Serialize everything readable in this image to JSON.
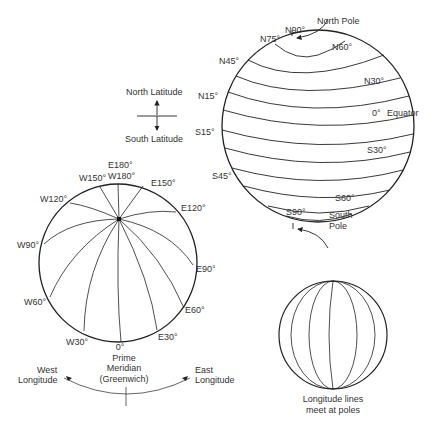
{
  "latitude_globe": {
    "labels": {
      "n90": "N90°",
      "n75": "N75°",
      "n60": "N60°",
      "n45": "N45°",
      "n30": "N30°",
      "n15": "N15°",
      "eq": "0°",
      "equator": "Equator",
      "s15": "S15°",
      "s30": "S30°",
      "s45": "S45°",
      "s60": "S60°",
      "s90": "S90°"
    },
    "north_pole": "North Pole",
    "south_pole_1": "South",
    "south_pole_2": "Pole"
  },
  "latitude_key": {
    "north": "North Latitude",
    "south": "South Latitude"
  },
  "longitude_globe": {
    "labels": {
      "e180": "E180°",
      "w180": "W180°",
      "w150": "W150°",
      "e150": "E150°",
      "w120": "W120°",
      "e120": "E120°",
      "w90": "W90°",
      "e90": "E90°",
      "w60": "W60°",
      "e60": "E60°",
      "w30": "W30°",
      "e30": "E30°",
      "zero": "0°"
    },
    "prime_1": "Prime",
    "prime_2": "Meridian",
    "prime_3": "(Greenwich)",
    "west_1": "West",
    "west_2": "Longitude",
    "east_1": "East",
    "east_2": "Longitude"
  },
  "small_globe": {
    "caption_1": "Longitude lines",
    "caption_2": "meet at poles"
  },
  "colors": {
    "line": "#222222",
    "text": "#333333",
    "background": "#ffffff"
  }
}
